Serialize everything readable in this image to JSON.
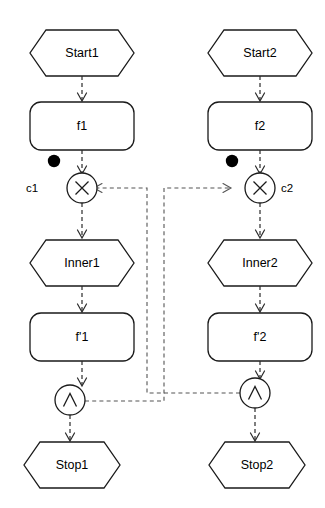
{
  "diagram": {
    "background_color": "#ffffff",
    "line_color": "#1a1a1a",
    "edge_color": "#2b2b2b",
    "sync_edge_color": "#555555",
    "token_color": "#000000",
    "columns": [
      {
        "id": "left",
        "nodes": {
          "start": {
            "label": "Start1",
            "shape": "hexagon"
          },
          "action": {
            "label": "f1",
            "shape": "rounded-rect"
          },
          "choice": {
            "label": "c1",
            "glyph": "X",
            "shape": "circle"
          },
          "inner": {
            "label": "Inner1",
            "shape": "hexagon"
          },
          "action_prime": {
            "label": "f'1",
            "shape": "rounded-rect"
          },
          "join": {
            "glyph": "∧",
            "shape": "circle"
          },
          "stop": {
            "label": "Stop1",
            "shape": "hexagon"
          }
        },
        "token": {
          "name": "token-marker",
          "present": "true"
        }
      },
      {
        "id": "right",
        "nodes": {
          "start": {
            "label": "Start2",
            "shape": "hexagon"
          },
          "action": {
            "label": "f2",
            "shape": "rounded-rect"
          },
          "choice": {
            "label": "c2",
            "glyph": "X",
            "shape": "circle"
          },
          "inner": {
            "label": "Inner2",
            "shape": "hexagon"
          },
          "action_prime": {
            "label": "f'2",
            "shape": "rounded-rect"
          },
          "join": {
            "glyph": "∧",
            "shape": "circle"
          },
          "stop": {
            "label": "Stop2",
            "shape": "hexagon"
          }
        },
        "token": {
          "name": "token-marker",
          "present": "true"
        }
      }
    ],
    "sync_edges": [
      {
        "from": "right-join",
        "to": "left-choice",
        "style": "dashed"
      },
      {
        "from": "left-join",
        "to": "right-choice",
        "style": "dashed"
      }
    ]
  }
}
